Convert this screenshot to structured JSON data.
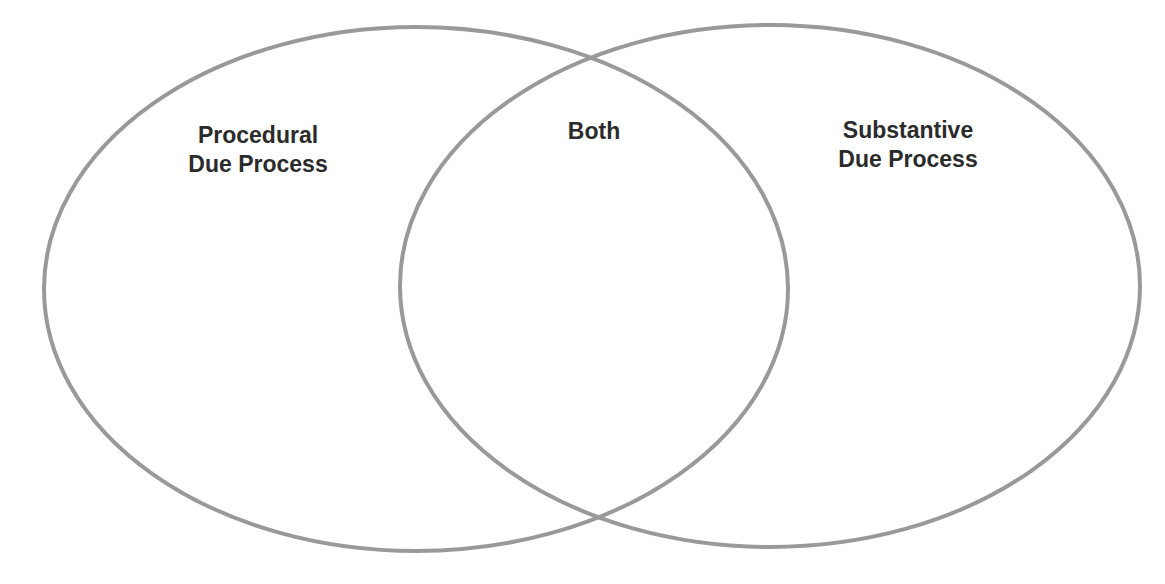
{
  "diagram": {
    "type": "venn",
    "stroke_color": "#999999",
    "text_color": "#2b2b2b",
    "background": "#ffffff",
    "sets": [
      {
        "id": "left",
        "label_lines": [
          "Procedural",
          "Due Process"
        ],
        "ellipse": {
          "cx": 416,
          "cy": 289,
          "rx": 372,
          "ry": 262
        }
      },
      {
        "id": "right",
        "label_lines": [
          "Substantive",
          "Due Process"
        ],
        "ellipse": {
          "cx": 770,
          "cy": 286,
          "rx": 370,
          "ry": 261
        }
      }
    ],
    "intersection": {
      "label": "Both"
    }
  }
}
